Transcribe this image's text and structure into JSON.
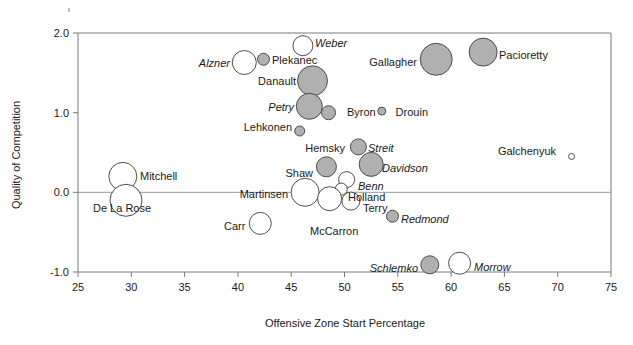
{
  "chart_data": {
    "type": "scatter",
    "title": "",
    "xlabel": "Offensive Zone Start Percentage",
    "ylabel": "Quality of Competition",
    "xlim": [
      25,
      75
    ],
    "ylim": [
      -1.0,
      2.0
    ],
    "xticks": [
      "25",
      "30",
      "35",
      "40",
      "45",
      "50",
      "55",
      "60",
      "65",
      "70",
      "75"
    ],
    "yticks": [
      "2.0",
      "1.0",
      "0.0",
      "-1.0"
    ],
    "grid": false,
    "legend": "none",
    "marker_size_meaning": "bubble size (time on ice)",
    "points": [
      {
        "label": "Weber",
        "x": 46.1,
        "y": 1.84,
        "r": 10,
        "fill": "white",
        "italic": true,
        "lx": 315,
        "ly": 47,
        "anchor": "start"
      },
      {
        "label": "Alzner",
        "x": 40.6,
        "y": 1.63,
        "r": 12,
        "fill": "white",
        "italic": true,
        "lx": 230,
        "ly": 67,
        "anchor": "end"
      },
      {
        "label": "Plekanec",
        "x": 42.4,
        "y": 1.67,
        "r": 6,
        "fill": "gray",
        "italic": false,
        "lx": 272,
        "ly": 64,
        "anchor": "start"
      },
      {
        "label": "Gallagher",
        "x": 58.6,
        "y": 1.67,
        "r": 16,
        "fill": "gray",
        "italic": false,
        "lx": 417,
        "ly": 66,
        "anchor": "end"
      },
      {
        "label": "Pacioretty",
        "x": 63.0,
        "y": 1.76,
        "r": 14,
        "fill": "gray",
        "italic": false,
        "lx": 499,
        "ly": 59,
        "anchor": "start"
      },
      {
        "label": "Danault",
        "x": 47.0,
        "y": 1.4,
        "r": 15,
        "fill": "gray",
        "italic": false,
        "lx": 296,
        "ly": 85,
        "anchor": "end"
      },
      {
        "label": "Petry",
        "x": 46.7,
        "y": 1.08,
        "r": 13,
        "fill": "gray",
        "italic": true,
        "lx": 294,
        "ly": 111,
        "anchor": "end"
      },
      {
        "label": "Byron",
        "x": 48.5,
        "y": 1.0,
        "r": 7,
        "fill": "gray",
        "italic": false,
        "lx": 347,
        "ly": 116,
        "anchor": "start"
      },
      {
        "label": "Drouin",
        "x": 53.5,
        "y": 1.02,
        "r": 4,
        "fill": "gray",
        "italic": false,
        "lx": 428,
        "ly": 116,
        "anchor": "end"
      },
      {
        "label": "Lehkonen",
        "x": 45.8,
        "y": 0.77,
        "r": 5,
        "fill": "gray",
        "italic": false,
        "lx": 292,
        "ly": 131,
        "anchor": "end"
      },
      {
        "label": "Hemsky",
        "x": 51.3,
        "y": 0.57,
        "r": 8,
        "fill": "gray",
        "italic": false,
        "lx": 345,
        "ly": 152,
        "anchor": "end"
      },
      {
        "label": "Streit",
        "x": 51.3,
        "y": 0.57,
        "r": 0,
        "fill": "gray",
        "italic": true,
        "lx": 368,
        "ly": 152,
        "anchor": "start"
      },
      {
        "label": "Galchenyuk",
        "x": 71.3,
        "y": 0.45,
        "r": 3,
        "fill": "white",
        "italic": false,
        "lx": 556,
        "ly": 155,
        "anchor": "end"
      },
      {
        "label": "Davidson",
        "x": 52.5,
        "y": 0.35,
        "r": 12,
        "fill": "gray",
        "italic": true,
        "lx": 382,
        "ly": 172,
        "anchor": "start"
      },
      {
        "label": "Shaw",
        "x": 48.3,
        "y": 0.32,
        "r": 10,
        "fill": "gray",
        "italic": false,
        "lx": 313,
        "ly": 177,
        "anchor": "end"
      },
      {
        "label": "Mitchell",
        "x": 29.2,
        "y": 0.2,
        "r": 14,
        "fill": "white",
        "italic": false,
        "lx": 140,
        "ly": 180,
        "anchor": "start"
      },
      {
        "label": "Benn",
        "x": 50.2,
        "y": 0.16,
        "r": 8,
        "fill": "white",
        "italic": true,
        "lx": 358,
        "ly": 190,
        "anchor": "start"
      },
      {
        "label": "Holland",
        "x": 49.7,
        "y": 0.04,
        "r": 6,
        "fill": "white",
        "italic": false,
        "lx": 348,
        "ly": 201,
        "anchor": "start"
      },
      {
        "label": "Martinsen",
        "x": 46.3,
        "y": 0.0,
        "r": 14,
        "fill": "white",
        "italic": false,
        "lx": 288,
        "ly": 198,
        "anchor": "end"
      },
      {
        "label": "De La Rose",
        "x": 29.5,
        "y": -0.1,
        "r": 16,
        "fill": "white",
        "italic": false,
        "lx": 93,
        "ly": 212,
        "anchor": "start"
      },
      {
        "label": "Terry",
        "x": 50.6,
        "y": -0.11,
        "r": 9,
        "fill": "white",
        "italic": false,
        "lx": 363,
        "ly": 212,
        "anchor": "start"
      },
      {
        "label": "McCarron",
        "x": 48.6,
        "y": -0.08,
        "r": 12,
        "fill": "white",
        "italic": false,
        "lx": 310,
        "ly": 235,
        "anchor": "start"
      },
      {
        "label": "Carr",
        "x": 42.1,
        "y": -0.39,
        "r": 11,
        "fill": "white",
        "italic": false,
        "lx": 224,
        "ly": 230,
        "anchor": "start"
      },
      {
        "label": "Redmond",
        "x": 54.5,
        "y": -0.3,
        "r": 6,
        "fill": "gray",
        "italic": true,
        "lx": 401,
        "ly": 223,
        "anchor": "start"
      },
      {
        "label": "Schlemko",
        "x": 58.0,
        "y": -0.91,
        "r": 9,
        "fill": "gray",
        "italic": true,
        "lx": 418,
        "ly": 272,
        "anchor": "end"
      },
      {
        "label": "Morrow",
        "x": 60.8,
        "y": -0.89,
        "r": 11,
        "fill": "white",
        "italic": true,
        "lx": 474,
        "ly": 271,
        "anchor": "start"
      }
    ]
  }
}
